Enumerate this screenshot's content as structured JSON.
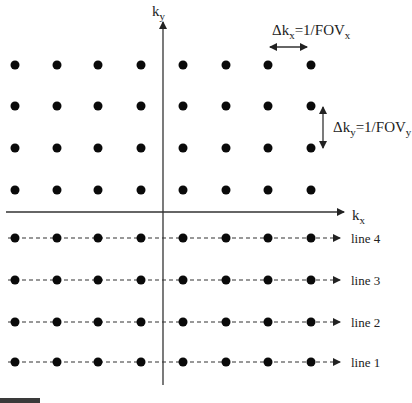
{
  "diagram": {
    "type": "k-space sampling grid",
    "axes": {
      "x_label_main": "k",
      "x_label_sub": "x",
      "y_label_main": "k",
      "y_label_sub": "y"
    },
    "annotations": {
      "dkx": {
        "delta": "Δk",
        "sub1": "x",
        "eq": "=1/FOV",
        "sub2": "x"
      },
      "dky": {
        "delta": "Δk",
        "sub1": "y",
        "eq": "=1/FOV",
        "sub2": "y"
      }
    },
    "grid": {
      "columns_x": [
        15,
        57,
        98,
        141,
        183,
        226,
        268,
        311
      ],
      "upper_rows_y": [
        65,
        106,
        148,
        190
      ],
      "dot_color": "#0a0a0a"
    },
    "readout_lines": [
      {
        "label": "line 4",
        "y": 238
      },
      {
        "label": "line 3",
        "y": 280
      },
      {
        "label": "line 2",
        "y": 322
      },
      {
        "label": "line 1",
        "y": 362
      }
    ]
  }
}
